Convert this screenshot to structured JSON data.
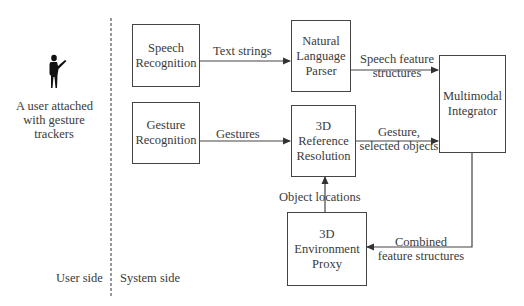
{
  "user_side": {
    "figure_icon": "person-pointing-icon",
    "caption_lines": [
      "A user attached",
      "with gesture",
      "trackers"
    ],
    "label": "User side"
  },
  "system_side": {
    "label": "System side"
  },
  "nodes": {
    "speech_recognition": {
      "lines": [
        "Speech",
        "Recognition"
      ]
    },
    "gesture_recognition": {
      "lines": [
        "Gesture",
        "Recognition"
      ]
    },
    "nl_parser": {
      "lines": [
        "Natural",
        "Language",
        "Parser"
      ]
    },
    "reference_resolution": {
      "lines": [
        "3D",
        "Reference",
        "Resolution"
      ]
    },
    "multimodal_integrator": {
      "lines": [
        "Multimodal",
        "Integrator"
      ]
    },
    "environment_proxy": {
      "lines": [
        "3D",
        "Environment",
        "Proxy"
      ]
    }
  },
  "edges": {
    "text_strings": {
      "lines": [
        "Text strings"
      ]
    },
    "speech_features": {
      "lines": [
        "Speech feature",
        "structures"
      ]
    },
    "gestures": {
      "lines": [
        "Gestures"
      ]
    },
    "gesture_selected": {
      "lines": [
        "Gesture,",
        "selected objects"
      ]
    },
    "object_locations": {
      "lines": [
        "Object locations"
      ]
    },
    "combined_features": {
      "lines": [
        "Combined",
        "feature structures"
      ]
    }
  },
  "colors": {
    "stroke": "#444444",
    "text": "#3a3a3a",
    "background": "#ffffff"
  }
}
